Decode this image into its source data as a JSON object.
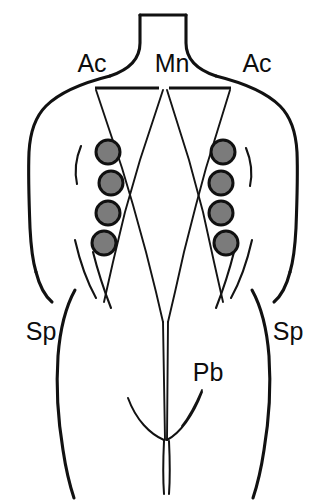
{
  "figure": {
    "type": "anatomical-line-drawing",
    "view": "posterior",
    "canvas": {
      "width": 325,
      "height": 504
    },
    "colors": {
      "background": "#ffffff",
      "outline": "#111111",
      "electrode_fill": "#7b7b7b",
      "electrode_stroke": "#101010",
      "label": "#0d0d0d"
    }
  },
  "labels": [
    {
      "id": "ac-left",
      "text": "Ac",
      "x": 92,
      "y": 72,
      "anchor": "middle"
    },
    {
      "id": "mn",
      "text": "Mn",
      "x": 172,
      "y": 72,
      "anchor": "middle"
    },
    {
      "id": "ac-right",
      "text": "Ac",
      "x": 257,
      "y": 72,
      "anchor": "middle"
    },
    {
      "id": "sp-left",
      "text": "Sp",
      "x": 41,
      "y": 340,
      "anchor": "middle"
    },
    {
      "id": "sp-right",
      "text": "Sp",
      "x": 288,
      "y": 340,
      "anchor": "middle"
    },
    {
      "id": "pb",
      "text": "Pb",
      "x": 208,
      "y": 381,
      "anchor": "middle"
    }
  ],
  "label_meanings": {
    "Ac": "Ac",
    "Mn": "Mn",
    "Sp": "Sp",
    "Pb": "Pb"
  },
  "electrodes": {
    "radius": 12,
    "count": 8,
    "left_column": [
      {
        "index": 1,
        "cx": 108,
        "cy": 152
      },
      {
        "index": 2,
        "cx": 111,
        "cy": 183
      },
      {
        "index": 3,
        "cx": 108,
        "cy": 213
      },
      {
        "index": 4,
        "cx": 104,
        "cy": 243
      }
    ],
    "right_column": [
      {
        "index": 1,
        "cx": 223,
        "cy": 152
      },
      {
        "index": 2,
        "cx": 221,
        "cy": 183
      },
      {
        "index": 3,
        "cx": 221,
        "cy": 213
      },
      {
        "index": 4,
        "cx": 226,
        "cy": 243
      }
    ]
  },
  "geometry": {
    "body_outline": "M 140 14 L 140 44 C 140 62 126 72 106 78 C 76 86 46 98 36 124 C 28 146 29 190 30 232 C 31 268 35 290 42 306 C 52 330 60 372 66 410 C 70 440 74 470 78 494 M 185 14 L 185 44 C 185 62 199 72 219 78 C 249 86 279 98 289 124 C 297 146 296 190 295 232 C 294 268 290 290 283 306 C 273 330 265 372 259 410 C 255 440 251 470 247 494 M 140 14 L 185 14",
    "scapular_line_left": "M 95 88 L 158 88",
    "scapular_line_right": "M 170 88 L 232 88",
    "v_left": "M 95 88 L 123 172 L 129 192",
    "v_right": "M 232 88 L 205 172 L 199 192",
    "v_center_left": "M 163 88 L 130 190 L 118 238 L 108 290 L 100 330",
    "v_center_right": "M 166 88 L 198 190 L 210 238 L 220 290 L 228 330",
    "midline_taper_left": "M 146 300 L 160 420",
    "midline_taper_right": "M 186 300 L 170 420",
    "gluteal_fold_left": "M 128 398 C 138 420 152 432 163 436",
    "gluteal_fold_right": "M 203 392 C 193 418 178 432 166 437",
    "gluteal_cleft": "M 164 437 L 164 490 M 169 437 L 169 490",
    "waist_tick_left": "M 79 145 C 75 158 74 170 78 184",
    "waist_tick_right": "M 248 148 C 252 160 253 172 249 186",
    "hip_crease_left": "M 76 232 C 84 250 92 266 103 282",
    "hip_crease_right": "M 251 232 C 243 250 235 266 224 282",
    "buttock_line_left": "M 84 246 C 90 280 96 296 104 312",
    "buttock_line_right": "M 243 246 C 237 280 231 296 223 312"
  }
}
